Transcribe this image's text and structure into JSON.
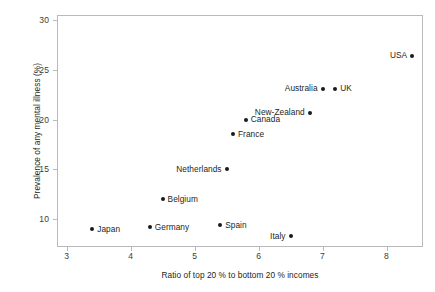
{
  "chart_data": {
    "type": "scatter",
    "title": "",
    "xlabel": "Ratio of top 20 % to bottom 20 % incomes",
    "ylabel": "Prevalence of any mental illness (%)",
    "xlim": [
      2.85,
      8.57
    ],
    "ylim": [
      7.2,
      30.5
    ],
    "xticks": [
      3,
      4,
      5,
      6,
      7,
      8
    ],
    "yticks": [
      10,
      15,
      20,
      25,
      30
    ],
    "xtick_labels": [
      "3",
      "4",
      "5",
      "6",
      "7",
      "8"
    ],
    "ytick_labels": [
      "10",
      "15",
      "20",
      "25",
      "30"
    ],
    "grid": false,
    "legend": null,
    "marker_color": "#1a1a1a",
    "frame_color": "#b9babb",
    "points": [
      {
        "label": "Japan",
        "x": 3.4,
        "y": 9.0,
        "label_side": "right"
      },
      {
        "label": "Germany",
        "x": 4.3,
        "y": 9.2,
        "label_side": "right"
      },
      {
        "label": "Belgium",
        "x": 4.5,
        "y": 12.0,
        "label_side": "right"
      },
      {
        "label": "Spain",
        "x": 5.4,
        "y": 9.4,
        "label_side": "right"
      },
      {
        "label": "Netherlands",
        "x": 5.5,
        "y": 15.0,
        "label_side": "left"
      },
      {
        "label": "France",
        "x": 5.6,
        "y": 18.5,
        "label_side": "right"
      },
      {
        "label": "Canada",
        "x": 5.8,
        "y": 20.0,
        "label_side": "right"
      },
      {
        "label": "Italy",
        "x": 6.5,
        "y": 8.3,
        "label_side": "left"
      },
      {
        "label": "New-Zealand",
        "x": 6.8,
        "y": 20.7,
        "label_side": "left"
      },
      {
        "label": "Australia",
        "x": 7.0,
        "y": 23.1,
        "label_side": "left"
      },
      {
        "label": "UK",
        "x": 7.2,
        "y": 23.1,
        "label_side": "right"
      },
      {
        "label": "USA",
        "x": 8.4,
        "y": 26.4,
        "label_side": "left"
      }
    ]
  }
}
